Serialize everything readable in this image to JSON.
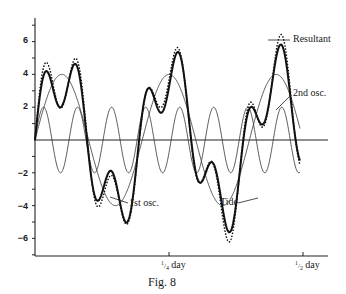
{
  "chart_data": {
    "type": "line",
    "title": "Fig. 8",
    "xlabel": "",
    "ylabel": "",
    "ylim": [
      -7,
      7
    ],
    "y_ticks": [
      "6",
      "4",
      "2",
      "-2",
      "-4",
      "-6"
    ],
    "x_ticks": [
      "1/4 day",
      "1/2 day"
    ],
    "grid": false,
    "legend_position": "inline annotations",
    "annotations": [
      "Resultant",
      "2nd osc.",
      "1st osc.",
      "Tide"
    ],
    "series": [
      {
        "name": "1st osc.",
        "style": "thin solid",
        "amplitude": 4,
        "period_fraction_of_day": 0.2
      },
      {
        "name": "2nd osc.",
        "style": "thin solid",
        "amplitude": 2,
        "period_fraction_of_day": 0.0635
      },
      {
        "name": "Resultant",
        "style": "thick solid",
        "description": "sum of 1st osc. and 2nd osc.",
        "approx_peaks": [
          4.8,
          6.2,
          6.0
        ],
        "approx_troughs": [
          -5.8,
          -6.2,
          -4.4
        ]
      },
      {
        "name": "Tide",
        "style": "dotted",
        "description": "observed tide, closely following resultant",
        "approx_peaks": [
          5.0,
          6.6,
          5.8
        ],
        "approx_troughs": [
          -5.5,
          -6.6,
          -4.8
        ]
      }
    ]
  },
  "labels": {
    "resultant": "Resultant",
    "second_osc": "2nd osc.",
    "first_osc": "1st osc.",
    "tide": "Tide",
    "caption": "Fig. 8",
    "x_quarter_num": "1",
    "x_quarter_den": "4",
    "x_half_num": "1",
    "x_half_den": "2",
    "day": "day",
    "y6": "6",
    "y4": "4",
    "y2": "2",
    "ym2": "−2",
    "ym4": "−4",
    "ym6": "−6"
  }
}
